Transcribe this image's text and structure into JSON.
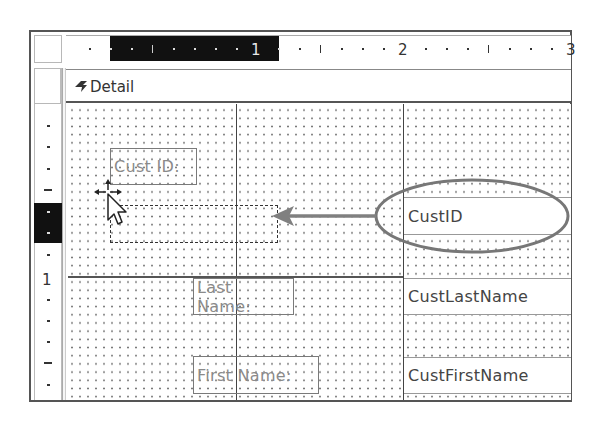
{
  "window": {
    "type": "Form Design View",
    "section": "Detail"
  },
  "top_ruler": {
    "labels": [
      "1",
      "2",
      "3"
    ],
    "highlight_range_inches": [
      0.5,
      1.5
    ]
  },
  "left_ruler": {
    "labels": [
      "1"
    ]
  },
  "section_bar": {
    "label": "Detail",
    "icon": "section-collapse-arrow-icon"
  },
  "controls": {
    "labels": [
      {
        "id": "cust-id-label",
        "text": "Cust ID:"
      },
      {
        "id": "last-name-label",
        "text": "Last Name:"
      },
      {
        "id": "first-name-label",
        "text": "First Name:"
      }
    ],
    "fields": [
      {
        "id": "custid-field",
        "text": "CustID",
        "highlighted": true
      },
      {
        "id": "custlastname-field",
        "text": "CustLastName"
      },
      {
        "id": "custfirstname-field",
        "text": "CustFirstName"
      }
    ]
  },
  "annotation": {
    "arrow": "drag CustID field to drop target",
    "oval_color": "#777777",
    "arrow_color": "#808080"
  },
  "cursor": {
    "type": "move-cursor",
    "icon": "pointer-with-move-arrows-icon"
  },
  "colors": {
    "ruler_highlight": "#111111",
    "grid_dot": "#777777",
    "label_text": "#8a8a8a",
    "field_text": "#444444",
    "border": "#555555"
  }
}
